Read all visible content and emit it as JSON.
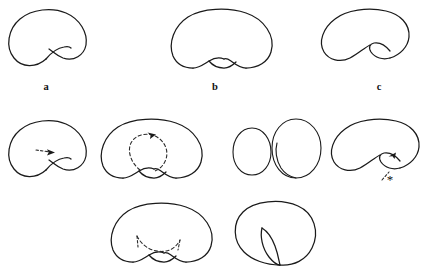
{
  "figure": {
    "kind": "topology-curve-diagram",
    "background_color": "#ffffff",
    "stroke_color": "#1a1a1a",
    "dashed_color": "#2b2b2b",
    "width": 435,
    "height": 277,
    "labels": [
      {
        "id": "a",
        "text": "a",
        "x": 46,
        "y": 82
      },
      {
        "id": "b",
        "text": "b",
        "x": 215,
        "y": 82
      },
      {
        "id": "c",
        "text": "c",
        "x": 379,
        "y": 82
      }
    ],
    "annotations": {
      "asterisk": "*"
    },
    "rows": [
      {
        "row": 1,
        "panels": [
          {
            "id": "a",
            "label": "a",
            "description": "closed curve with single crossing at bottom center"
          },
          {
            "id": "b",
            "label": "b",
            "description": "closed curve with small lens bump at bottom center, no crossing"
          },
          {
            "id": "c",
            "label": "c",
            "description": "closed curve with crossing shifted right forming a right-side loop"
          }
        ]
      },
      {
        "row": 2,
        "panels": [
          {
            "id": "a2",
            "label": "",
            "description": "curve a with small dashed arrow at the crossing pointing right"
          },
          {
            "id": "b2",
            "label": "",
            "description": "curve b with dashed oval loop inside and arrowhead at top pointing right"
          },
          {
            "id": "oval-small",
            "label": "",
            "description": "plain small oval"
          },
          {
            "id": "oval-curl",
            "label": "",
            "description": "oval with inner curl on the left side"
          },
          {
            "id": "c2",
            "label": "",
            "description": "curve c with arrowhead in the right loop and dashed line to an asterisk"
          }
        ]
      },
      {
        "row": 3,
        "panels": [
          {
            "id": "b3",
            "label": "",
            "description": "curve b with dashed concave arc and short dashed tails inside"
          },
          {
            "id": "d3",
            "label": "",
            "description": "kidney curve with narrow pinched fold near bottom center-left"
          }
        ]
      }
    ]
  }
}
